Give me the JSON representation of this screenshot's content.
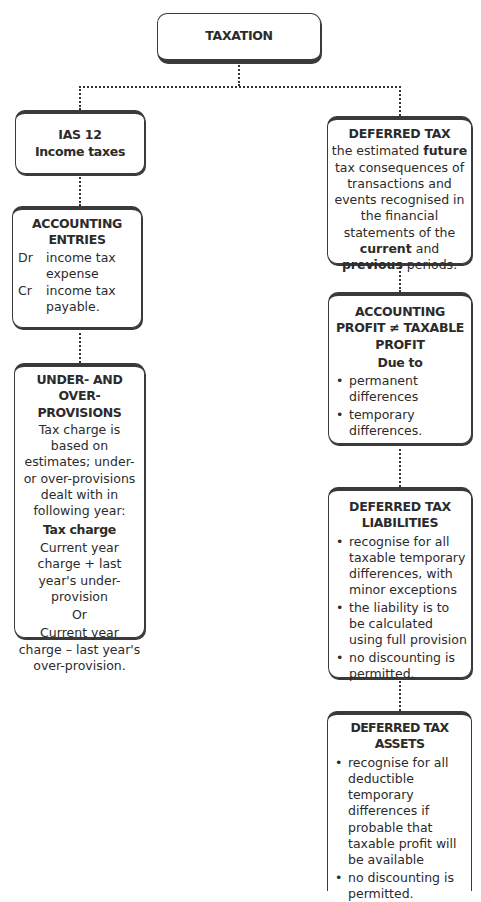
{
  "diagram": {
    "root": {
      "label": "TAXATION"
    },
    "left": {
      "ias": {
        "line1": "IAS 12",
        "line2": "Income taxes"
      },
      "accounting_entries": {
        "title": "ACCOUNTING ENTRIES",
        "entries": [
          {
            "side": "Dr",
            "text": "income tax expense"
          },
          {
            "side": "Cr",
            "text": "income tax payable."
          }
        ]
      },
      "under_over": {
        "title": "UNDER- AND OVER-PROVISIONS",
        "description": "Tax charge is based on estimates; under- or over-provisions dealt with in following year:",
        "subtitle": "Tax charge",
        "option1": "Current year charge + last year's under-provision",
        "or": "Or",
        "option2": "Current year  charge – last year's over-provision."
      }
    },
    "right": {
      "deferred_tax": {
        "title": "DEFERRED TAX",
        "text_parts": {
          "p1": "the estimated ",
          "b1": "future",
          "p2": " tax consequences of transactions and events recognised in the financial statements of the ",
          "b2": "current",
          "p3": " and ",
          "b3": "previous",
          "p4": " periods."
        }
      },
      "accounting_profit": {
        "title": "ACCOUNTING PROFIT ≠ TAXABLE PROFIT",
        "subtitle": "Due to",
        "bullets": [
          "permanent differences",
          "temporary differences."
        ]
      },
      "liabilities": {
        "title": "DEFERRED TAX LIABILITIES",
        "bullets": [
          "recognise for all taxable temporary differences, with minor exceptions",
          "the liability is to be calculated using full provision",
          "no discounting is permitted."
        ]
      },
      "assets": {
        "title": "DEFERRED TAX ASSETS",
        "bullets": [
          "recognise for all deductible temporary differences if probable that taxable profit will be available",
          "no discounting is permitted."
        ]
      }
    }
  },
  "colors": {
    "border": "#3a3a3a",
    "text": "#2b2b2b",
    "background": "#ffffff"
  }
}
